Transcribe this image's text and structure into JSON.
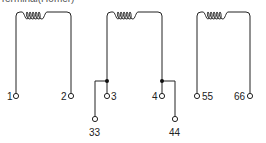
{
  "title": "Terminal(Homer)",
  "colors": {
    "line": "#222222",
    "background": "#ffffff"
  },
  "coils": [
    {
      "name": "coil-1",
      "terminals": [
        {
          "label": "1",
          "type": "end"
        },
        {
          "label": "2",
          "type": "end"
        }
      ]
    },
    {
      "name": "coil-2",
      "terminals": [
        {
          "label": "3",
          "type": "end"
        },
        {
          "label": "33",
          "type": "tap"
        },
        {
          "label": "4",
          "type": "end"
        },
        {
          "label": "44",
          "type": "tap"
        }
      ]
    },
    {
      "name": "coil-3",
      "terminals": [
        {
          "label": "55",
          "type": "end"
        },
        {
          "label": "66",
          "type": "end"
        }
      ]
    }
  ]
}
